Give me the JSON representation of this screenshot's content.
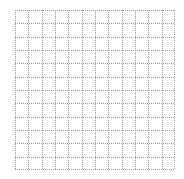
{
  "grid": {
    "columns": 12,
    "rows": 12,
    "line_color": "#9a9a9a",
    "line_style": "dotted",
    "background": "#ffffff"
  }
}
